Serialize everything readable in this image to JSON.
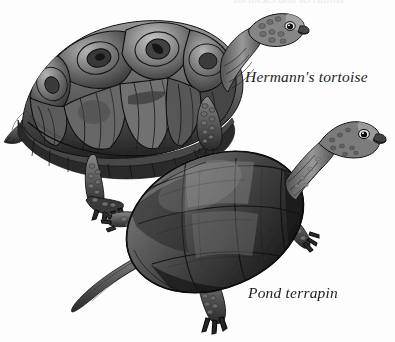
{
  "plate": {
    "background_color": "#fdfdfd",
    "style": "grayscale-pen-and-ink-natural-history-illustration",
    "width": 395,
    "height": 342,
    "cropped_top_text": "Tortoises and terrapins"
  },
  "labels": {
    "tortoise": "Hermann's tortoise",
    "terrapin": "Pond terrapin",
    "text_color": "#1d1d1d"
  },
  "subjects": [
    {
      "id": "hermanns-tortoise",
      "label": "Hermann's tortoise",
      "common_name": "Hermann's tortoise",
      "orientation": "three-quarter view facing right",
      "carapace": "high-domed, strongly segmented scutes with concentric growth rings",
      "limbs": "stumpy, heavily scaled elephantine legs with blunt claws",
      "tail": "short",
      "position": "upper-left",
      "shell_tone_range": [
        "#2a2a2a",
        "#8f8f8f",
        "#d8d8d8"
      ]
    },
    {
      "id": "pond-terrapin",
      "label": "Pond terrapin",
      "common_name": "Pond terrapin",
      "orientation": "three-quarter view facing upper right",
      "carapace": "low, smooth oval shell with faint scute seams",
      "limbs": "slender, webbed, long-clawed limbs",
      "tail": "long, tapering, extending to lower left",
      "position": "lower-right",
      "shell_tone_range": [
        "#1e1e1e",
        "#5a5a5a",
        "#a6a6a6"
      ]
    }
  ],
  "palette": {
    "ink_darkest": "#161616",
    "ink_dark": "#2e2e2e",
    "ink_mid": "#5c5c5c",
    "ink_light": "#9a9a9a",
    "ink_pale": "#cfcfcf",
    "paper": "#fdfdfd"
  }
}
